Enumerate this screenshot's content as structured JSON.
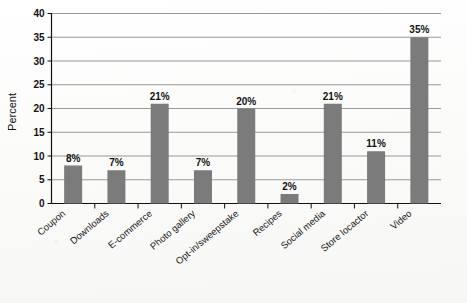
{
  "chart_data": {
    "type": "bar",
    "title": "",
    "subtitle": "",
    "xlabel": "",
    "ylabel": "Percent",
    "ylim": [
      0,
      40
    ],
    "ytick_step": 5,
    "yticks": [
      0,
      5,
      10,
      15,
      20,
      25,
      30,
      35,
      40
    ],
    "ytick_labels": [
      "0",
      "5",
      "10",
      "15",
      "20",
      "25",
      "30",
      "35",
      "40"
    ],
    "grid": true,
    "grid_axis": "y",
    "legend": false,
    "legend_position": "none",
    "value_label_suffix": "%",
    "bar_color": "#7b7b7b",
    "categories": [
      "Coupon",
      "Downloads",
      "E-commerce",
      "Photo gallery",
      "Opt-in/sweepstake",
      "Recipes",
      "Social media",
      "Store locactor",
      "Video"
    ],
    "values": [
      8,
      7,
      21,
      7,
      20,
      2,
      21,
      11,
      35
    ],
    "value_labels": [
      "8%",
      "7%",
      "21%",
      "7%",
      "20%",
      "2%",
      "21%",
      "11%",
      "35%"
    ]
  },
  "colors": {
    "bar": "#7b7b7b",
    "gridline": "#8d8d8d",
    "axis": "#111111",
    "background": "#fcfcfb",
    "text": "#1a1a1a"
  }
}
